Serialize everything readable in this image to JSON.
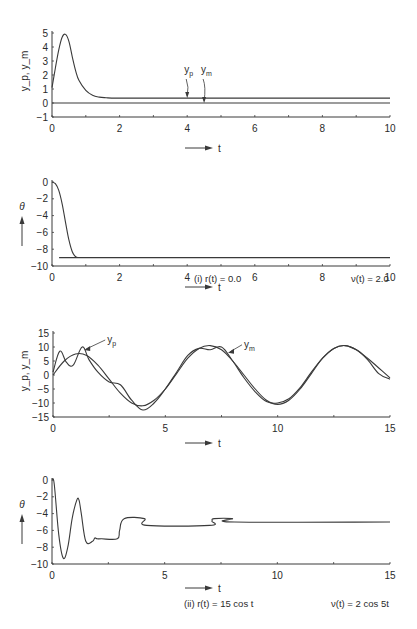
{
  "chart_data": [
    {
      "id": "plot-i-output",
      "type": "line",
      "title": "",
      "xlabel": "t",
      "ylabel": "y_p, y_m",
      "xlim": [
        0,
        10
      ],
      "ylim": [
        -1,
        5
      ],
      "xticks": [
        0,
        2,
        4,
        6,
        8,
        10
      ],
      "yticks": [
        -1,
        0,
        1,
        2,
        3,
        4,
        5
      ],
      "grid": false,
      "annotations": [
        {
          "text": "y_p",
          "x": 4.0,
          "y": 0.35
        },
        {
          "text": "y_m",
          "x": 4.5,
          "y": 0.0
        }
      ],
      "series": [
        {
          "name": "y_p",
          "x": [
            0,
            0.1,
            0.2,
            0.3,
            0.4,
            0.5,
            0.6,
            0.7,
            0.8,
            1.0,
            1.2,
            1.4,
            1.6,
            2.0,
            4.0,
            10.0
          ],
          "y": [
            1.1,
            2.5,
            3.8,
            4.7,
            4.9,
            4.4,
            3.3,
            2.3,
            1.6,
            0.9,
            0.55,
            0.42,
            0.38,
            0.35,
            0.35,
            0.35
          ]
        },
        {
          "name": "y_m",
          "x": [
            0,
            10
          ],
          "y": [
            0,
            0
          ]
        }
      ]
    },
    {
      "id": "plot-i-theta",
      "type": "line",
      "title": "",
      "xlabel": "t",
      "ylabel": "θ",
      "xlim": [
        0,
        10
      ],
      "ylim": [
        -10,
        0
      ],
      "xticks": [
        0,
        2,
        4,
        6,
        8,
        10
      ],
      "yticks": [
        -10,
        -8,
        -6,
        -4,
        -2,
        0
      ],
      "grid": false,
      "series": [
        {
          "name": "θ",
          "x": [
            0,
            0.1,
            0.2,
            0.3,
            0.4,
            0.5,
            0.6,
            0.7,
            0.8,
            1.0,
            10.0
          ],
          "y": [
            0,
            -0.2,
            -1.0,
            -2.6,
            -4.8,
            -6.9,
            -8.3,
            -8.9,
            -9.0,
            -9.0,
            -9.0
          ]
        }
      ],
      "caption_left": "(i)  r(t) = 0.0",
      "caption_right": "ν(t) = 2.0"
    },
    {
      "id": "plot-ii-output",
      "type": "line",
      "title": "",
      "xlabel": "t",
      "ylabel": "y_p, y_m",
      "xlim": [
        0,
        15
      ],
      "ylim": [
        -15,
        15
      ],
      "xticks": [
        0,
        5,
        10,
        15
      ],
      "yticks": [
        -15,
        -10,
        -5,
        0,
        5,
        10,
        15
      ],
      "grid": false,
      "annotations": [
        {
          "text": "y_p",
          "x": 1.3,
          "y": 10
        },
        {
          "text": "y_m",
          "x": 7.7,
          "y": 9
        }
      ],
      "series": [
        {
          "name": "y_p",
          "x": [
            0,
            0.3,
            0.6,
            0.9,
            1.3,
            1.6,
            2.0,
            2.5,
            3.0,
            3.5,
            4.0,
            4.5,
            5.0,
            5.5,
            6.0,
            6.5,
            7.0,
            7.5,
            8.0,
            8.5,
            9.0,
            9.5,
            10.0,
            10.5,
            11.0,
            11.5,
            12.0,
            12.5,
            13.0,
            13.5,
            14.0,
            14.5,
            15.0
          ],
          "y": [
            1,
            8.5,
            4.5,
            3.5,
            10,
            5.5,
            1,
            -2.5,
            -3.5,
            -9,
            -12.5,
            -10,
            -5,
            1,
            7,
            9.5,
            9,
            10,
            5,
            -1,
            -6,
            -9.5,
            -10,
            -8.5,
            -4.5,
            1,
            6,
            9.5,
            10.5,
            9,
            6,
            2.5,
            -1
          ]
        },
        {
          "name": "y_m",
          "x": [
            0,
            0.5,
            1.0,
            1.5,
            2.0,
            2.5,
            3.0,
            3.5,
            4.0,
            4.5,
            5.0,
            5.5,
            6.0,
            6.5,
            7.0,
            7.5,
            8.0,
            8.5,
            9.0,
            9.5,
            10.0,
            10.5,
            11.0,
            11.5,
            12.0,
            12.5,
            13.0,
            13.5,
            14.0,
            14.5,
            15.0
          ],
          "y": [
            0,
            5,
            7.5,
            7,
            3.5,
            -1.5,
            -6.5,
            -10,
            -11,
            -9,
            -5,
            0.5,
            6,
            9.5,
            10.5,
            9,
            5,
            0,
            -5,
            -9,
            -10.5,
            -9,
            -5,
            0.5,
            6,
            9.5,
            10.5,
            9,
            5.5,
            0.5,
            -1.5
          ]
        }
      ]
    },
    {
      "id": "plot-ii-theta",
      "type": "line",
      "title": "",
      "xlabel": "t",
      "ylabel": "θ",
      "xlim": [
        0,
        15
      ],
      "ylim": [
        -10,
        0
      ],
      "xticks": [
        0,
        5,
        10,
        15
      ],
      "yticks": [
        -10,
        -8,
        -6,
        -4,
        -2,
        0
      ],
      "grid": false,
      "series": [
        {
          "name": "θ",
          "x": [
            0,
            0.1,
            0.3,
            0.5,
            0.7,
            0.9,
            1.1,
            1.2,
            1.3,
            1.5,
            1.8,
            1.9,
            2.0,
            2.2,
            2.9,
            3.0,
            3.2,
            4.1,
            4.2,
            7.0,
            7.1,
            7.2,
            8.0,
            8.1,
            15.0
          ],
          "y": [
            0,
            -0.5,
            -6.5,
            -9.3,
            -8.0,
            -4.5,
            -2.4,
            -2.4,
            -4.0,
            -7.3,
            -7.3,
            -6.9,
            -7.0,
            -7.0,
            -7.0,
            -6.0,
            -4.6,
            -4.6,
            -5.4,
            -5.4,
            -4.9,
            -4.6,
            -4.6,
            -5.0,
            -5.0
          ]
        }
      ],
      "caption_left": "(ii)  r(t) = 15 cos t",
      "caption_right": "ν(t) = 2 cos 5t"
    }
  ],
  "labels": {
    "t_arrow": "t",
    "ylabel_output": "y_p, y_m",
    "ylabel_theta": "θ",
    "ann_yp": "y",
    "ann_yp_sub": "p",
    "ann_ym": "y",
    "ann_ym_sub": "m",
    "caption_i_left": "(i)  r(t) = 0.0",
    "caption_i_right": "ν(t) = 2.0",
    "caption_ii_left": "(ii)  r(t) = 15 cos t",
    "caption_ii_right": "ν(t) = 2 cos 5t"
  }
}
